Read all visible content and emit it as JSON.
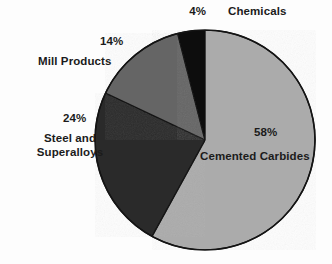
{
  "chart_data": {
    "type": "pie",
    "title": "",
    "subtitle": "",
    "xlabel": "",
    "ylabel": "",
    "legend_position": "none",
    "grid": false,
    "units": "percent",
    "start_angle_deg": 0,
    "direction": "clockwise",
    "center": {
      "x": 205,
      "y": 140
    },
    "radius": 110,
    "categories": [
      "Cemented Carbides",
      "Steel and Superalloys",
      "Mill Products",
      "Chemicals"
    ],
    "values": [
      58,
      24,
      14,
      4
    ],
    "labels": [
      "58%",
      "24%",
      "14%",
      "4%"
    ],
    "colors": [
      "#ababab",
      "#2b2b2b",
      "#656565",
      "#0d0d0d"
    ],
    "slices": [
      {
        "name": "Cemented Carbides",
        "value": 58,
        "percent_label": "58%",
        "color": "#ababab",
        "start_deg": 0,
        "end_deg": 208.8,
        "label_placement": "inside",
        "label_color": "#1b1b1b"
      },
      {
        "name": "Steel and Superalloys",
        "value": 24,
        "percent_label": "24%",
        "color": "#2b2b2b",
        "start_deg": 208.8,
        "end_deg": 295.2,
        "label_placement": "outside-left",
        "label_color": "#1b1b1b"
      },
      {
        "name": "Mill Products",
        "value": 14,
        "percent_label": "14%",
        "color": "#656565",
        "start_deg": 295.2,
        "end_deg": 345.6,
        "label_placement": "outside-upper-left",
        "label_color": "#1b1b1b"
      },
      {
        "name": "Chemicals",
        "value": 4,
        "percent_label": "4%",
        "color": "#0d0d0d",
        "start_deg": 345.6,
        "end_deg": 360,
        "label_placement": "outside-top",
        "label_color": "#1b1b1b"
      }
    ]
  },
  "labels": {
    "chemicals_pct": "4%",
    "chemicals_name": "Chemicals",
    "mill_pct": "14%",
    "mill_name": "Mill Products",
    "steel_pct": "24%",
    "steel_name_line1": "Steel and",
    "steel_name_line2": "Superalloys",
    "carbides_pct": "58%",
    "carbides_name": "Cemented Carbides"
  },
  "style": {
    "background": "#fdfdfd",
    "outline": "#141414",
    "text": "#1b1b1b",
    "slice_cemented_carbides": "#ababab",
    "slice_steel_superalloys": "#2b2b2b",
    "slice_mill_products": "#656565",
    "slice_chemicals": "#0d0d0d"
  }
}
